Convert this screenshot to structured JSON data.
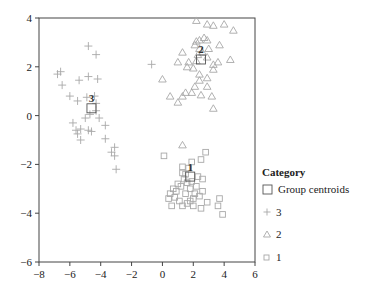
{
  "chart_data": {
    "type": "scatter",
    "title": "",
    "xlabel": "",
    "ylabel": "",
    "xlim": [
      -8,
      6
    ],
    "ylim": [
      -6,
      4
    ],
    "x_ticks": [
      -8,
      -6,
      -4,
      -2,
      0,
      2,
      4,
      6
    ],
    "y_ticks": [
      -6,
      -4,
      -2,
      0,
      2,
      4
    ],
    "x_tick_labels": [
      "−8",
      "−6",
      "−4",
      "−2",
      "0",
      "2",
      "4",
      "6"
    ],
    "y_tick_labels": [
      "−6",
      "−4",
      "−2",
      "0",
      "2",
      "4"
    ],
    "grid": false,
    "legend": {
      "title": "Category",
      "position": "right",
      "entries": [
        {
          "label": "Group centroids",
          "marker": "large-square"
        },
        {
          "label": "3",
          "marker": "plus"
        },
        {
          "label": "2",
          "marker": "triangle"
        },
        {
          "label": "1",
          "marker": "square"
        }
      ]
    },
    "centroids": [
      {
        "group": "3",
        "label": "3",
        "x": -4.6,
        "y": 0.3
      },
      {
        "group": "2",
        "label": "2",
        "x": 2.5,
        "y": 2.3
      },
      {
        "group": "1",
        "label": "1",
        "x": 1.8,
        "y": -2.5
      }
    ],
    "series": [
      {
        "name": "3",
        "marker": "plus",
        "points": [
          [
            -4.8,
            2.85
          ],
          [
            -4.3,
            2.5
          ],
          [
            -6.8,
            1.7
          ],
          [
            -6.6,
            1.8
          ],
          [
            -6.5,
            1.25
          ],
          [
            -5.4,
            1.45
          ],
          [
            -4.8,
            1.6
          ],
          [
            -4.2,
            1.5
          ],
          [
            -6.0,
            0.8
          ],
          [
            -5.5,
            0.6
          ],
          [
            -4.9,
            0.75
          ],
          [
            -4.4,
            0.8
          ],
          [
            -4.3,
            0.5
          ],
          [
            -4.3,
            0.2
          ],
          [
            -4.7,
            0.05
          ],
          [
            -5.0,
            -0.1
          ],
          [
            -4.1,
            -0.1
          ],
          [
            -5.8,
            -0.3
          ],
          [
            -5.6,
            -0.6
          ],
          [
            -5.3,
            -0.55
          ],
          [
            -5.5,
            -0.75
          ],
          [
            -4.8,
            -0.6
          ],
          [
            -4.6,
            -0.65
          ],
          [
            -3.7,
            -0.4
          ],
          [
            -5.3,
            -1.0
          ],
          [
            -3.7,
            -0.95
          ],
          [
            -3.1,
            -1.3
          ],
          [
            -3.3,
            -1.5
          ],
          [
            -3.1,
            -1.65
          ],
          [
            -3.0,
            -2.2
          ],
          [
            -0.7,
            2.1
          ]
        ]
      },
      {
        "name": "2",
        "marker": "triangle",
        "points": [
          [
            2.2,
            3.9
          ],
          [
            2.9,
            3.75
          ],
          [
            3.3,
            3.7
          ],
          [
            4.6,
            3.5
          ],
          [
            2.2,
            3.05
          ],
          [
            2.4,
            3.1
          ],
          [
            2.7,
            3.2
          ],
          [
            2.9,
            3.1
          ],
          [
            2.1,
            2.9
          ],
          [
            2.4,
            2.75
          ],
          [
            3.0,
            2.75
          ],
          [
            2.3,
            2.5
          ],
          [
            2.6,
            2.6
          ],
          [
            2.9,
            2.4
          ],
          [
            1.3,
            2.6
          ],
          [
            1.0,
            2.2
          ],
          [
            1.7,
            2.2
          ],
          [
            2.2,
            2.25
          ],
          [
            3.3,
            2.1
          ],
          [
            3.6,
            2.2
          ],
          [
            4.4,
            2.3
          ],
          [
            1.6,
            2.0
          ],
          [
            2.0,
            1.95
          ],
          [
            2.4,
            1.7
          ],
          [
            3.3,
            1.9
          ],
          [
            2.9,
            1.55
          ],
          [
            2.4,
            1.45
          ],
          [
            2.1,
            1.2
          ],
          [
            0.0,
            1.5
          ],
          [
            1.9,
            0.95
          ],
          [
            1.5,
            0.95
          ],
          [
            2.9,
            1.2
          ],
          [
            3.2,
            0.8
          ],
          [
            0.5,
            0.8
          ],
          [
            1.3,
            0.8
          ],
          [
            3.3,
            0.3
          ],
          [
            1.0,
            0.55
          ],
          [
            2.5,
            0.85
          ],
          [
            4.0,
            3.75
          ],
          [
            3.7,
            2.9
          ],
          [
            1.3,
            -1.2
          ]
        ]
      },
      {
        "name": "1",
        "marker": "square",
        "points": [
          [
            2.8,
            -1.5
          ],
          [
            1.9,
            -1.9
          ],
          [
            2.5,
            -1.8
          ],
          [
            0.1,
            -1.65
          ],
          [
            1.3,
            -2.1
          ],
          [
            1.7,
            -2.15
          ],
          [
            1.3,
            -2.35
          ],
          [
            1.5,
            -2.4
          ],
          [
            2.3,
            -2.5
          ],
          [
            2.6,
            -2.6
          ],
          [
            1.0,
            -2.8
          ],
          [
            0.7,
            -3.0
          ],
          [
            1.2,
            -2.9
          ],
          [
            1.6,
            -2.75
          ],
          [
            1.9,
            -2.7
          ],
          [
            1.8,
            -3.0
          ],
          [
            0.5,
            -3.2
          ],
          [
            0.9,
            -3.1
          ],
          [
            1.5,
            -3.2
          ],
          [
            2.1,
            -3.2
          ],
          [
            2.6,
            -3.1
          ],
          [
            0.4,
            -3.4
          ],
          [
            1.1,
            -3.5
          ],
          [
            1.8,
            -3.5
          ],
          [
            2.0,
            -3.4
          ],
          [
            2.4,
            -3.3
          ],
          [
            0.6,
            -3.7
          ],
          [
            1.3,
            -3.7
          ],
          [
            1.6,
            -3.6
          ],
          [
            2.0,
            -3.7
          ],
          [
            2.5,
            -3.8
          ],
          [
            3.7,
            -3.4
          ],
          [
            3.6,
            -3.7
          ],
          [
            3.9,
            -4.05
          ],
          [
            1.4,
            -2.6
          ],
          [
            2.2,
            -2.9
          ],
          [
            0.8,
            -3.35
          ],
          [
            2.9,
            -3.55
          ]
        ]
      }
    ]
  }
}
